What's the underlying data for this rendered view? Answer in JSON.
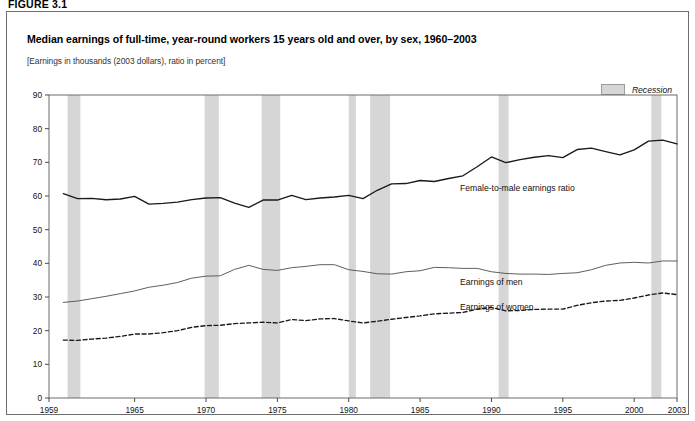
{
  "figure": {
    "label": "FIGURE 3.1"
  },
  "chart": {
    "title": "Median earnings of full-time, year-round workers 15 years old and over, by sex, 1960–2003",
    "subtitle": "[Earnings in thousands (2003 dollars), ratio in percent]",
    "legend": {
      "recession_label": "Recession",
      "recession_color": "#d6d6d6"
    },
    "annotations": {
      "ratio": "Female-to-male earnings ratio",
      "men": "Earnings of men",
      "women": "Earnings of women"
    }
  },
  "chart_data": {
    "type": "line",
    "title": "Median earnings of full-time, year-round workers 15 years old and over, by sex, 1960–2003",
    "subtitle": "[Earnings in thousands (2003 dollars), ratio in percent]",
    "xlabel": "",
    "ylabel": "",
    "xlim": [
      1959,
      2003
    ],
    "ylim": [
      0,
      90
    ],
    "yticks": [
      0,
      10,
      20,
      30,
      40,
      50,
      60,
      70,
      80,
      90
    ],
    "xticks": [
      1959,
      1965,
      1970,
      1975,
      1980,
      1985,
      1990,
      1995,
      2000,
      2003
    ],
    "grid": false,
    "legend_position": "top-right",
    "x": [
      1960,
      1961,
      1962,
      1963,
      1964,
      1965,
      1966,
      1967,
      1968,
      1969,
      1970,
      1971,
      1972,
      1973,
      1974,
      1975,
      1976,
      1977,
      1978,
      1979,
      1980,
      1981,
      1982,
      1983,
      1984,
      1985,
      1986,
      1987,
      1988,
      1989,
      1990,
      1991,
      1992,
      1993,
      1994,
      1995,
      1996,
      1997,
      1998,
      1999,
      2000,
      2001,
      2002,
      2003
    ],
    "series": [
      {
        "name": "Female-to-male earnings ratio",
        "style": "solid-thick",
        "color": "#1a1a1a",
        "unit": "percent",
        "values": [
          60.7,
          59.2,
          59.3,
          58.9,
          59.1,
          59.9,
          57.6,
          57.8,
          58.2,
          58.9,
          59.4,
          59.5,
          57.9,
          56.6,
          58.8,
          58.8,
          60.2,
          58.9,
          59.4,
          59.7,
          60.2,
          59.2,
          61.7,
          63.6,
          63.7,
          64.6,
          64.3,
          65.2,
          66.0,
          68.7,
          71.6,
          69.9,
          70.8,
          71.5,
          72.0,
          71.4,
          73.8,
          74.2,
          73.2,
          72.2,
          73.7,
          76.3,
          76.6,
          75.5
        ]
      },
      {
        "name": "Earnings of men",
        "style": "solid-thin",
        "color": "#555555",
        "unit": "thousands of 2003 dollars",
        "values": [
          28.4,
          28.8,
          29.5,
          30.2,
          31.0,
          31.8,
          32.9,
          33.5,
          34.3,
          35.6,
          36.2,
          36.3,
          38.2,
          39.4,
          38.2,
          37.9,
          38.7,
          39.1,
          39.6,
          39.6,
          38.1,
          37.6,
          36.9,
          36.8,
          37.5,
          37.8,
          38.8,
          38.7,
          38.5,
          38.5,
          37.5,
          37.0,
          36.8,
          36.8,
          36.7,
          37.0,
          37.2,
          38.1,
          39.4,
          40.1,
          40.3,
          40.1,
          40.7,
          40.7
        ]
      },
      {
        "name": "Earnings of women",
        "style": "dashed",
        "color": "#1a1a1a",
        "unit": "thousands of 2003 dollars",
        "values": [
          17.2,
          17.1,
          17.5,
          17.8,
          18.3,
          19.0,
          19.0,
          19.4,
          20.0,
          21.0,
          21.5,
          21.6,
          22.1,
          22.3,
          22.5,
          22.3,
          23.3,
          23.0,
          23.5,
          23.6,
          22.9,
          22.3,
          22.8,
          23.4,
          23.9,
          24.4,
          25.0,
          25.2,
          25.4,
          26.4,
          26.9,
          25.9,
          26.0,
          26.3,
          26.4,
          26.4,
          27.5,
          28.3,
          28.8,
          29.0,
          29.7,
          30.6,
          31.2,
          30.7
        ]
      }
    ],
    "recessions": [
      {
        "start": 1960.3,
        "end": 1961.2
      },
      {
        "start": 1969.9,
        "end": 1970.9
      },
      {
        "start": 1973.9,
        "end": 1975.2
      },
      {
        "start": 1980.0,
        "end": 1980.5
      },
      {
        "start": 1981.5,
        "end": 1982.9
      },
      {
        "start": 1990.5,
        "end": 1991.2
      },
      {
        "start": 2001.2,
        "end": 2001.9
      }
    ]
  }
}
